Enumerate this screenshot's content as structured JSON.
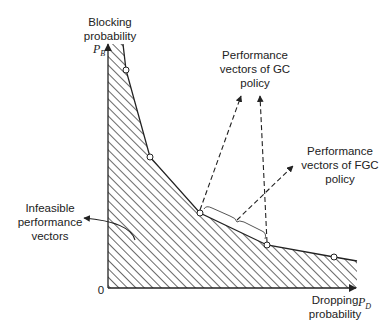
{
  "diagram": {
    "y_axis": {
      "label_line1": "Blocking",
      "label_line2": "probability",
      "symbol": "P",
      "symbol_sub": "B"
    },
    "x_axis": {
      "label_line1": "Dropping",
      "label_line2": "probability",
      "symbol": "P",
      "symbol_sub": "D"
    },
    "origin": "0",
    "annotations": {
      "gc": {
        "line1": "Performance",
        "line2": "vectors of GC",
        "line3": "policy"
      },
      "fgc": {
        "line1": "Performance",
        "line2": "vectors of FGC",
        "line3": "policy"
      },
      "infeasible": {
        "line1": "Infeasible",
        "line2": "performance",
        "line3": "vectors"
      }
    },
    "boundary_points": [
      [
        126,
        70
      ],
      [
        150,
        157
      ],
      [
        200,
        213
      ],
      [
        267,
        245
      ],
      [
        334,
        257
      ]
    ],
    "colors": {
      "ink": "#222222",
      "hatch": "#444444",
      "background": "#ffffff"
    }
  }
}
